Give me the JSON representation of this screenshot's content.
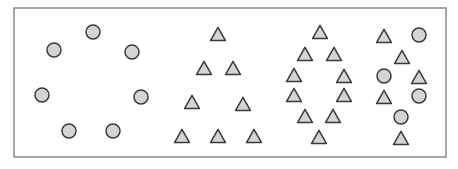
{
  "figure": {
    "frame": {
      "x": 14,
      "y": 8,
      "width": 432,
      "height": 149,
      "stroke": "#6e6e6e"
    },
    "colors": {
      "fill": "#d4d4d4",
      "stroke": "#3a3a3a"
    },
    "circle_radius": 7,
    "triangle_size": 15,
    "groups": [
      {
        "name": "circle-ring",
        "shapes": [
          {
            "type": "circle",
            "x": 93,
            "y": 32
          },
          {
            "type": "circle",
            "x": 54,
            "y": 50
          },
          {
            "type": "circle",
            "x": 132,
            "y": 52
          },
          {
            "type": "circle",
            "x": 42,
            "y": 95
          },
          {
            "type": "circle",
            "x": 141,
            "y": 97
          },
          {
            "type": "circle",
            "x": 69,
            "y": 131
          },
          {
            "type": "circle",
            "x": 113,
            "y": 131
          }
        ]
      },
      {
        "name": "triangle-pyramid",
        "shapes": [
          {
            "type": "triangle",
            "x": 218,
            "y": 34
          },
          {
            "type": "triangle",
            "x": 204,
            "y": 68
          },
          {
            "type": "triangle",
            "x": 233,
            "y": 68
          },
          {
            "type": "triangle",
            "x": 192,
            "y": 102
          },
          {
            "type": "triangle",
            "x": 243,
            "y": 104
          },
          {
            "type": "triangle",
            "x": 182,
            "y": 136
          },
          {
            "type": "triangle",
            "x": 218,
            "y": 136
          },
          {
            "type": "triangle",
            "x": 254,
            "y": 136
          }
        ]
      },
      {
        "name": "triangle-diamond",
        "shapes": [
          {
            "type": "triangle",
            "x": 320,
            "y": 32
          },
          {
            "type": "triangle",
            "x": 305,
            "y": 54
          },
          {
            "type": "triangle",
            "x": 334,
            "y": 54
          },
          {
            "type": "triangle",
            "x": 294,
            "y": 75
          },
          {
            "type": "triangle",
            "x": 344,
            "y": 76
          },
          {
            "type": "triangle",
            "x": 294,
            "y": 95
          },
          {
            "type": "triangle",
            "x": 344,
            "y": 95
          },
          {
            "type": "triangle",
            "x": 305,
            "y": 116
          },
          {
            "type": "triangle",
            "x": 333,
            "y": 116
          },
          {
            "type": "triangle",
            "x": 319,
            "y": 137
          }
        ]
      },
      {
        "name": "mixed-cluster",
        "shapes": [
          {
            "type": "triangle",
            "x": 384,
            "y": 36
          },
          {
            "type": "circle",
            "x": 419,
            "y": 35
          },
          {
            "type": "triangle",
            "x": 402,
            "y": 57
          },
          {
            "type": "circle",
            "x": 384,
            "y": 76
          },
          {
            "type": "triangle",
            "x": 419,
            "y": 77
          },
          {
            "type": "triangle",
            "x": 384,
            "y": 97
          },
          {
            "type": "circle",
            "x": 419,
            "y": 96
          },
          {
            "type": "circle",
            "x": 401,
            "y": 117
          },
          {
            "type": "triangle",
            "x": 401,
            "y": 138
          }
        ]
      }
    ]
  }
}
